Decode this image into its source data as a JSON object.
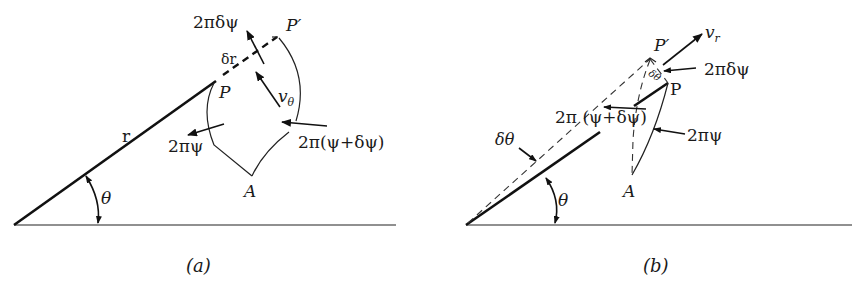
{
  "figure": {
    "panels": [
      {
        "id": "a",
        "caption": "(a)",
        "labels": {
          "r": "r",
          "theta": "θ",
          "P": "P",
          "P_prime": "P′",
          "A": "A",
          "delta_r": "δr",
          "v_theta": "v",
          "v_theta_sub": "θ",
          "flux_delta": "2πδψ",
          "flux_psi": "2πψ",
          "flux_psi_plus": "2π(ψ+δψ)"
        }
      },
      {
        "id": "b",
        "caption": "(b)",
        "labels": {
          "theta": "θ",
          "delta_theta": "δθ",
          "delta_theta_small": "δθ",
          "P": "P",
          "P_prime": "P′",
          "A": "A",
          "v_r": "v",
          "v_r_sub": "r",
          "flux_delta": "2πδψ",
          "flux_psi": "2πψ",
          "flux_psi_plus": "2π (ψ+δψ)"
        }
      }
    ]
  }
}
